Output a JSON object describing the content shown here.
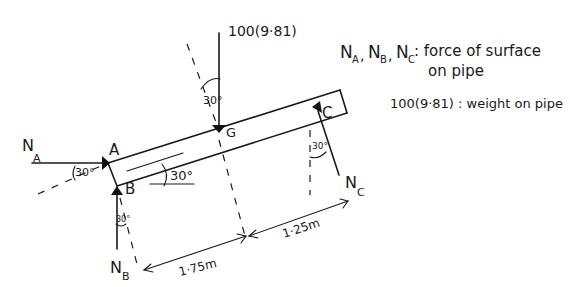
{
  "diagram": {
    "points": {
      "A": "A",
      "B": "B",
      "C": "C",
      "G": "G"
    },
    "forces": {
      "NA": {
        "main": "N",
        "sub": "A"
      },
      "NB": {
        "main": "N",
        "sub": "B"
      },
      "NC": {
        "main": "N",
        "sub": "C"
      },
      "weight": "100(9·81)"
    },
    "angles": {
      "NA": "30°",
      "pipe": "30°",
      "NB": "30°",
      "NC": "30°",
      "weight": "30°"
    },
    "dimensions": {
      "B_to_G": "1·75m",
      "G_to_C": "1·25m"
    },
    "legend": {
      "line1_symbols": [
        {
          "main": "N",
          "sub": "A"
        },
        {
          "main": "N",
          "sub": "B"
        },
        {
          "main": "N",
          "sub": "C"
        }
      ],
      "line1_text": ": force of surface",
      "line2_text": "on pipe",
      "line3_text": "100(9·81) : weight on pipe"
    },
    "colors": {
      "ink": "#1a1a1a",
      "background": "#ffffff"
    }
  }
}
